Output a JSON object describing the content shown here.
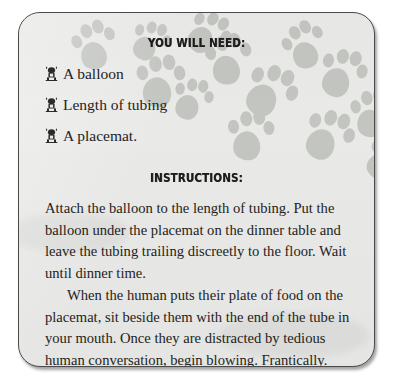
{
  "card": {
    "background_color": "#e9e9e7",
    "border_color": "#4a4a4a",
    "paw_color": "#c3c5c1"
  },
  "sections": {
    "need": {
      "heading": "YOU WILL NEED:",
      "items": [
        {
          "bullet_icon": "dog-bullet-icon",
          "label": "A balloon"
        },
        {
          "bullet_icon": "dog-bullet-icon",
          "label": "Length of tubing"
        },
        {
          "bullet_icon": "dog-bullet-icon",
          "label": "A placemat."
        }
      ]
    },
    "instructions": {
      "heading": "INSTRUCTIONS:",
      "paragraphs": [
        "Attach the balloon to the length of tubing. Put the balloon under the placemat on the dinner table and leave the tubing trailing discreetly to the floor. Wait until dinner time.",
        "When the human puts their plate of food on the placemat, sit beside them with the end of the tube in your mouth. Once they are distracted by tedious human conversation, begin blowing. Frantically."
      ]
    }
  },
  "decoration": {
    "paw_prints": [
      {
        "x": 52,
        "y": 6,
        "rotate": -22,
        "scale": 0.95
      },
      {
        "x": 108,
        "y": 2,
        "rotate": 14,
        "scale": 0.82
      },
      {
        "x": 118,
        "y": 42,
        "rotate": -8,
        "scale": 1.05
      },
      {
        "x": 166,
        "y": -6,
        "rotate": 26,
        "scale": 0.9
      },
      {
        "x": 186,
        "y": 20,
        "rotate": -14,
        "scale": 1.0
      },
      {
        "x": 150,
        "y": 60,
        "rotate": 8,
        "scale": 0.85
      },
      {
        "x": 228,
        "y": 52,
        "rotate": 20,
        "scale": 1.1
      },
      {
        "x": 208,
        "y": 96,
        "rotate": -6,
        "scale": 1.0
      },
      {
        "x": 262,
        "y": 6,
        "rotate": -30,
        "scale": 0.92
      },
      {
        "x": 300,
        "y": 34,
        "rotate": 10,
        "scale": 1.0
      },
      {
        "x": 286,
        "y": 96,
        "rotate": 16,
        "scale": 1.05
      },
      {
        "x": 330,
        "y": 74,
        "rotate": -12,
        "scale": 0.95
      },
      {
        "x": 344,
        "y": 120,
        "rotate": 22,
        "scale": 0.88
      }
    ]
  }
}
